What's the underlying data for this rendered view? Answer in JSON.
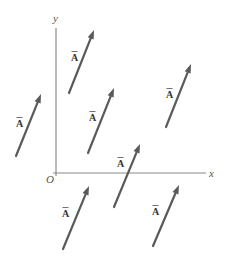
{
  "diagram": {
    "type": "vector-translation",
    "axes": {
      "x_label": "x",
      "y_label": "y",
      "origin_label": "O",
      "origin": [
        56,
        173
      ],
      "x_end": [
        206,
        173
      ],
      "y_end": [
        56,
        28
      ],
      "color": "#8a8a8a"
    },
    "vector_label": "A",
    "vector_color": "#5a5a5a",
    "vectors": [
      {
        "id": "v1",
        "tail": [
          69,
          93
        ],
        "head": [
          94,
          30
        ],
        "label_pos": [
          71,
          61
        ]
      },
      {
        "id": "v2",
        "tail": [
          88,
          153
        ],
        "head": [
          114,
          88
        ],
        "label_pos": [
          89,
          121
        ]
      },
      {
        "id": "v3",
        "tail": [
          166,
          127
        ],
        "head": [
          191,
          64
        ],
        "label_pos": [
          166,
          98
        ]
      },
      {
        "id": "v4",
        "tail": [
          16,
          156
        ],
        "head": [
          41,
          94
        ],
        "label_pos": [
          16,
          127
        ]
      },
      {
        "id": "v5",
        "tail": [
          114,
          207
        ],
        "head": [
          140,
          144
        ],
        "label_pos": [
          117,
          167
        ]
      },
      {
        "id": "v6",
        "tail": [
          63,
          249
        ],
        "head": [
          89,
          186
        ],
        "label_pos": [
          62,
          217
        ]
      },
      {
        "id": "v7",
        "tail": [
          153,
          246
        ],
        "head": [
          179,
          185
        ],
        "label_pos": [
          152,
          215
        ]
      }
    ]
  }
}
